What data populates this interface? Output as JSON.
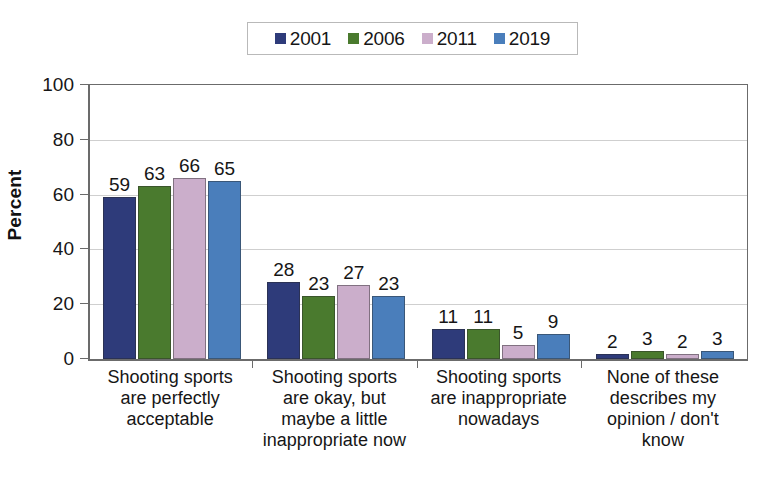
{
  "chart_data": {
    "type": "bar",
    "title": "",
    "xlabel": "",
    "ylabel": "Percent",
    "ylim": [
      0,
      100
    ],
    "ytick_step": 20,
    "yticks": [
      0,
      20,
      40,
      60,
      80,
      100
    ],
    "grid": true,
    "legend_position": "top-center",
    "categories": [
      "Shooting sports are perfectly acceptable",
      "Shooting sports are okay, but maybe a little inappropriate now",
      "Shooting sports are inappropriate nowadays",
      "None of these describes my opinion / don't know"
    ],
    "category_lines": [
      [
        "Shooting sports",
        "are perfectly",
        "acceptable"
      ],
      [
        "Shooting sports",
        "are okay, but",
        "maybe a little",
        "inappropriate now"
      ],
      [
        "Shooting sports",
        "are inappropriate",
        "nowadays"
      ],
      [
        "None of these",
        "describes my",
        "opinion / don't",
        "know"
      ]
    ],
    "series": [
      {
        "name": "2001",
        "color": "#2e3b7a",
        "values": [
          59,
          28,
          11,
          2
        ]
      },
      {
        "name": "2006",
        "color": "#4a7a2e",
        "values": [
          63,
          23,
          11,
          3
        ]
      },
      {
        "name": "2011",
        "color": "#cbaecb",
        "values": [
          66,
          27,
          5,
          2
        ]
      },
      {
        "name": "2019",
        "color": "#4a7ebb",
        "values": [
          65,
          23,
          9,
          3
        ]
      }
    ]
  },
  "legend": {
    "items": [
      {
        "label": "2001",
        "color": "#2e3b7a"
      },
      {
        "label": "2006",
        "color": "#4a7a2e"
      },
      {
        "label": "2011",
        "color": "#cbaecb"
      },
      {
        "label": "2019",
        "color": "#4a7ebb"
      }
    ]
  },
  "axis": {
    "y_title": "Percent",
    "y_labels": [
      "100",
      "80",
      "60",
      "40",
      "20",
      "0"
    ]
  }
}
